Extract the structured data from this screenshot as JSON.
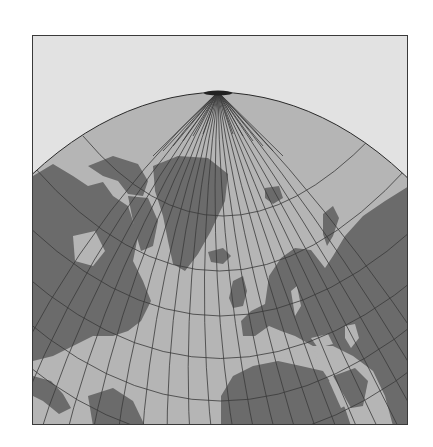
{
  "map": {
    "projection": "oblique azimuthal",
    "view": "North Atlantic centered, North Pole at top",
    "colors": {
      "background": "#e2e2e2",
      "ocean": "#b5b5b5",
      "land": "#6b6b6b",
      "graticule": "#3a3a3a",
      "frame": "#3a3a3a"
    },
    "graticule": {
      "meridian_count": 36,
      "parallels_visible": 6
    },
    "regions_depicted": [
      "North America",
      "Greenland",
      "Iceland",
      "Europe",
      "Scandinavia",
      "British Isles",
      "Africa",
      "Asia",
      "South America",
      "Arabian Peninsula",
      "India"
    ]
  }
}
